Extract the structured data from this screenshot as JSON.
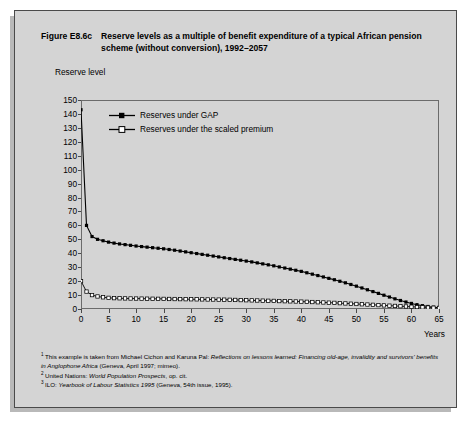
{
  "figure": {
    "number": "Figure E8.6c",
    "title": "Reserve levels as a multiple of benefit expenditure of a typical African pension scheme (without conversion), 1992–2057"
  },
  "colors": {
    "card_background": "#d4d4d4",
    "card_border": "#4a4a4a",
    "plot_frame": "#6b6b6b",
    "series_gap": "#000000",
    "series_scaled_fill": "#ffffff",
    "series_scaled_stroke": "#000000"
  },
  "legend": {
    "position": "top-left-inside",
    "entries": [
      {
        "label": "Reserves under GAP",
        "marker": "filled-diamond-marker",
        "fill": "#000000"
      },
      {
        "label": "Reserves under the scaled premium",
        "marker": "open-square-marker",
        "fill": "#ffffff"
      }
    ]
  },
  "footnotes": [
    {
      "marker": "1",
      "parts": [
        {
          "text": "This example is taken from Michael Cichon and Karuna Pal: ",
          "italic": false
        },
        {
          "text": "Reflections on lessons learned: Financing old-age, invalidity and survivors' benefits in Anglophone Africa",
          "italic": true
        },
        {
          "text": " (Geneva, April 1997; mimeo).",
          "italic": false
        }
      ]
    },
    {
      "marker": "2",
      "parts": [
        {
          "text": "United Nations: ",
          "italic": false
        },
        {
          "text": "World Population Prospects",
          "italic": true
        },
        {
          "text": ", op. cit.",
          "italic": false
        }
      ]
    },
    {
      "marker": "3",
      "parts": [
        {
          "text": "ILO: ",
          "italic": false
        },
        {
          "text": "Yearbook of Labour Statistics 1995",
          "italic": true
        },
        {
          "text": " (Geneva, 54th issue, 1995).",
          "italic": false
        }
      ]
    }
  ],
  "chart_data": {
    "type": "line",
    "title": "Reserve levels as a multiple of benefit expenditure of a typical African pension scheme (without conversion), 1992–2057",
    "xlabel": "Years",
    "ylabel": "Reserve level",
    "xlim": [
      0,
      65
    ],
    "ylim": [
      0,
      150
    ],
    "xticks": [
      0,
      5,
      10,
      15,
      20,
      25,
      30,
      35,
      40,
      45,
      50,
      55,
      60,
      65
    ],
    "yticks": [
      0,
      10,
      20,
      30,
      40,
      50,
      60,
      70,
      80,
      90,
      100,
      110,
      120,
      130,
      140,
      150
    ],
    "grid": false,
    "x": [
      0,
      1,
      2,
      3,
      4,
      5,
      6,
      7,
      8,
      9,
      10,
      11,
      12,
      13,
      14,
      15,
      16,
      17,
      18,
      19,
      20,
      21,
      22,
      23,
      24,
      25,
      26,
      27,
      28,
      29,
      30,
      31,
      32,
      33,
      34,
      35,
      36,
      37,
      38,
      39,
      40,
      41,
      42,
      43,
      44,
      45,
      46,
      47,
      48,
      49,
      50,
      51,
      52,
      53,
      54,
      55,
      56,
      57,
      58,
      59,
      60,
      61,
      62,
      63,
      64,
      65
    ],
    "series": [
      {
        "name": "Reserves under GAP",
        "marker": "filled-diamond",
        "values": [
          143,
          60,
          52,
          50,
          49,
          48,
          47.3,
          46.7,
          46.2,
          45.7,
          45.2,
          44.8,
          44.4,
          44,
          43.6,
          43.2,
          42.7,
          42.2,
          41.6,
          41,
          40.4,
          39.8,
          39.2,
          38.6,
          38,
          37.4,
          36.8,
          36.2,
          35.6,
          35,
          34.4,
          33.8,
          33.1,
          32.4,
          31.7,
          31,
          30.2,
          29.4,
          28.6,
          27.8,
          27,
          26,
          25,
          24,
          23,
          22,
          21,
          19.9,
          18.8,
          17.6,
          16.4,
          15.1,
          13.8,
          12.5,
          11.2,
          9.9,
          8.6,
          7.3,
          6.1,
          5,
          4,
          3.1,
          2.4,
          1.8,
          1.3,
          1
        ]
      },
      {
        "name": "Reserves under the scaled premium",
        "marker": "open-square",
        "values": [
          20,
          12.5,
          10,
          9,
          8.4,
          8,
          7.8,
          7.7,
          7.6,
          7.55,
          7.5,
          7.45,
          7.4,
          7.35,
          7.3,
          7.25,
          7.2,
          7.15,
          7.1,
          7.05,
          7,
          6.95,
          6.9,
          6.85,
          6.8,
          6.75,
          6.7,
          6.6,
          6.5,
          6.4,
          6.3,
          6.2,
          6.1,
          6,
          5.9,
          5.8,
          5.7,
          5.6,
          5.5,
          5.4,
          5.3,
          5.15,
          5,
          4.85,
          4.7,
          4.55,
          4.4,
          4.2,
          4,
          3.8,
          3.6,
          3.4,
          3.2,
          3,
          2.8,
          2.6,
          2.4,
          2.2,
          2,
          1.8,
          1.6,
          1.4,
          1.2,
          1.05,
          0.9,
          0.8
        ]
      }
    ]
  }
}
